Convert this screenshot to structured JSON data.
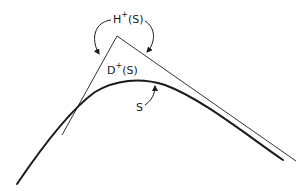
{
  "diagram": {
    "labels": {
      "horizon": {
        "base": "H",
        "sup": "+",
        "arg": "(S)"
      },
      "domain": {
        "base": "D",
        "sup": "+",
        "arg": "(S)"
      },
      "surface": "S"
    },
    "colors": {
      "ink": "#1a1a1a",
      "thin_line": "#333333",
      "background": "#ffffff"
    }
  }
}
